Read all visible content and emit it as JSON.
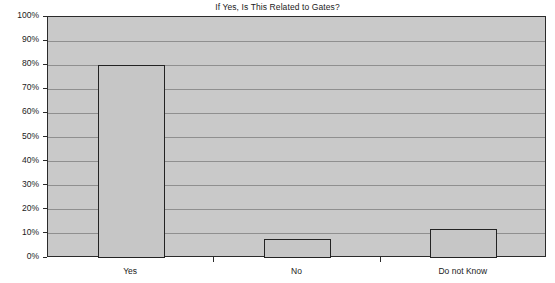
{
  "chart_data": {
    "type": "bar",
    "title": "If Yes, Is This Related to Gates?",
    "xlabel": "",
    "ylabel": "",
    "categories": [
      "Yes",
      "No",
      "Do not Know"
    ],
    "values": [
      80,
      8,
      12
    ],
    "value_labels": [
      "80%",
      "8%",
      "12%"
    ],
    "ylim": [
      0,
      100
    ],
    "ytick_values": [
      0,
      10,
      20,
      30,
      40,
      50,
      60,
      70,
      80,
      90,
      100
    ],
    "ytick_labels": [
      "0%",
      "10%",
      "20%",
      "30%",
      "40%",
      "50%",
      "60%",
      "70%",
      "80%",
      "90%",
      "100%"
    ],
    "grid": true,
    "legend": false,
    "legend_position": "none",
    "series": [
      {
        "name": "Response share",
        "values": [
          80,
          8,
          12
        ]
      }
    ],
    "colors": {
      "plot_background": "#c9c9c9",
      "page_background": "#ffffff",
      "bar_fill": "#c6c6c6",
      "bar_border": "#232323",
      "gridline": "#8f8f8f",
      "axis": "#2b2b2b",
      "text": "#1b1b1b"
    }
  }
}
